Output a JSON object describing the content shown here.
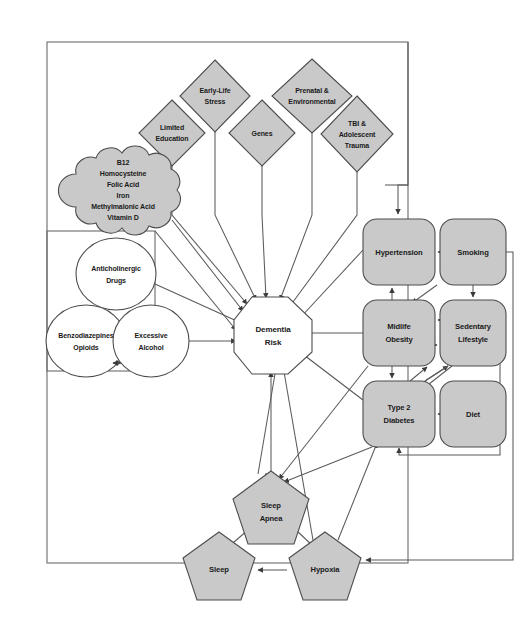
{
  "diagram": {
    "colors": {
      "node_fill": "#c9c9c9",
      "node_fill_white": "#ffffff",
      "node_stroke": "#4d4d4d",
      "edge_stroke": "#5a5a5a",
      "frame_stroke": "#6b6b6b",
      "background": "#ffffff"
    },
    "center": {
      "label": "Dementia Risk",
      "lines": [
        "Dementia",
        "Risk"
      ],
      "shape": "octagon",
      "fill": "white"
    },
    "diamonds": [
      {
        "id": "limited-education",
        "lines": [
          "Limited",
          "Education"
        ],
        "shape": "diamond",
        "cx": 172,
        "cy": 133,
        "rx": 33,
        "ry": 33
      },
      {
        "id": "early-life-stress",
        "lines": [
          "Early-Life",
          "Stress"
        ],
        "shape": "diamond",
        "cx": 215,
        "cy": 96,
        "rx": 35,
        "ry": 36
      },
      {
        "id": "genes",
        "lines": [
          "Genes"
        ],
        "shape": "diamond",
        "cx": 262,
        "cy": 133,
        "rx": 33,
        "ry": 33
      },
      {
        "id": "prenatal-environmental",
        "lines": [
          "Prenatal &",
          "Environmental"
        ],
        "shape": "diamond",
        "cx": 312,
        "cy": 96,
        "rx": 40,
        "ry": 37
      },
      {
        "id": "tbi-adolescent-trauma",
        "lines": [
          "TBI &",
          "Adolescent",
          "Trauma"
        ],
        "shape": "diamond",
        "cx": 357,
        "cy": 134,
        "rx": 36,
        "ry": 38
      }
    ],
    "cloud": {
      "id": "nutrient-panel",
      "lines": [
        "B12",
        "Homocysteine",
        "Folic Acid",
        "Iron",
        "Methylmalonic Acid",
        "Vitamin D"
      ],
      "shape": "cloud",
      "cx": 123,
      "cy": 190
    },
    "ellipses": [
      {
        "id": "anticholinergic-drugs",
        "lines": [
          "Anticholinergic",
          "Drugs"
        ],
        "shape": "ellipse",
        "cx": 116,
        "cy": 274,
        "rx": 40,
        "ry": 36
      },
      {
        "id": "benzodiazepines-opioids",
        "lines": [
          "Benzodiazepines",
          "Opioids"
        ],
        "shape": "ellipse",
        "cx": 86,
        "cy": 341,
        "rx": 40,
        "ry": 36
      },
      {
        "id": "excessive-alcohol",
        "lines": [
          "Excessive",
          "Alcohol"
        ],
        "shape": "ellipse",
        "cx": 151,
        "cy": 341,
        "rx": 38,
        "ry": 36
      }
    ],
    "boxes": [
      {
        "id": "hypertension",
        "lines": [
          "Hypertension"
        ],
        "shape": "rounded-rect",
        "x": 363,
        "y": 219,
        "w": 72,
        "h": 66
      },
      {
        "id": "smoking",
        "lines": [
          "Smoking"
        ],
        "shape": "rounded-rect",
        "x": 440,
        "y": 219,
        "w": 66,
        "h": 66
      },
      {
        "id": "midlife-obesity",
        "lines": [
          "Midlife",
          "Obesity"
        ],
        "shape": "rounded-rect",
        "x": 363,
        "y": 300,
        "w": 72,
        "h": 66
      },
      {
        "id": "sedentary-lifestyle",
        "lines": [
          "Sedentary",
          "Lifestyle"
        ],
        "shape": "rounded-rect",
        "x": 440,
        "y": 300,
        "w": 66,
        "h": 66
      },
      {
        "id": "type-2-diabetes",
        "lines": [
          "Type 2",
          "Diabetes"
        ],
        "shape": "rounded-rect",
        "x": 363,
        "y": 381,
        "w": 72,
        "h": 66
      },
      {
        "id": "diet",
        "lines": [
          "Diet"
        ],
        "shape": "rounded-rect",
        "x": 440,
        "y": 381,
        "w": 66,
        "h": 66
      }
    ],
    "pentagons": [
      {
        "id": "sleep-apnea",
        "lines": [
          "Sleep",
          "Apnea"
        ],
        "shape": "pentagon",
        "cx": 271,
        "cy": 511,
        "r": 40
      },
      {
        "id": "sleep",
        "lines": [
          "Sleep"
        ],
        "shape": "pentagon",
        "cx": 219,
        "cy": 570,
        "r": 38
      },
      {
        "id": "hypoxia",
        "lines": [
          "Hypoxia"
        ],
        "shape": "pentagon",
        "cx": 325,
        "cy": 570,
        "r": 38
      }
    ],
    "frames": [
      {
        "id": "outer-frame",
        "x": 47,
        "y": 42,
        "w": 361,
        "h": 521
      },
      {
        "id": "medication-frame",
        "x": 47,
        "y": 231,
        "w": 108,
        "h": 140
      }
    ]
  }
}
